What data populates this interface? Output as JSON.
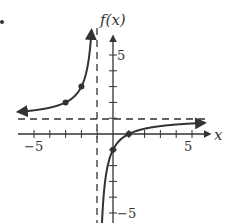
{
  "chart_data": {
    "type": "line",
    "title": "",
    "xlabel": "x",
    "ylabel": "f(x)",
    "xlim": [
      -6,
      6
    ],
    "ylim": [
      -5.6,
      6.4
    ],
    "x_ticks": [
      -5,
      -4,
      -3,
      -2,
      -1,
      0,
      1,
      2,
      3,
      4,
      5
    ],
    "y_ticks": [
      -5,
      -4,
      -3,
      -2,
      -1,
      0,
      1,
      2,
      3,
      4,
      5
    ],
    "x_tick_labels": {
      "-5": "−5",
      "5": "5"
    },
    "y_tick_labels": {
      "5": "5",
      "-5": "−5"
    },
    "function": "f(x) = -2/(x+1) + 1",
    "asymptotes": {
      "vertical": -1,
      "horizontal": 1
    },
    "series": [
      {
        "name": "left branch",
        "x": [
          -6,
          -5,
          -4,
          -3,
          -2,
          -1.6,
          -1.4
        ],
        "y": [
          1.4,
          1.5,
          1.67,
          2,
          3,
          4.33,
          6
        ]
      },
      {
        "name": "right branch",
        "x": [
          -0.7,
          -0.5,
          0,
          1,
          2,
          3,
          4,
          5,
          6
        ],
        "y": [
          -5.67,
          -3,
          -1,
          0,
          0.33,
          0.5,
          0.6,
          0.67,
          0.71
        ]
      }
    ],
    "marked_points": [
      [
        -3,
        2
      ],
      [
        -2,
        3
      ],
      [
        0,
        -1
      ],
      [
        1,
        0
      ]
    ],
    "grid": false,
    "legend": null
  },
  "labels": {
    "x_axis": "x",
    "y_axis": "f(x)",
    "tick_x_neg5": "−5",
    "tick_x_pos5": "5",
    "tick_y_pos5": "5",
    "tick_y_neg5": "−5"
  }
}
